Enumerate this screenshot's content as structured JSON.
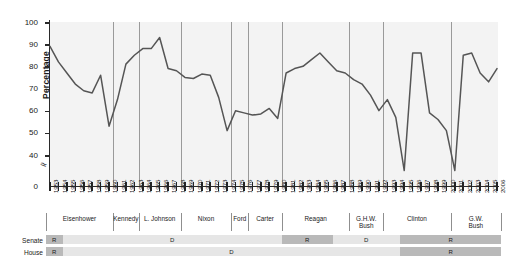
{
  "chart_data": {
    "type": "line",
    "title": "",
    "xlabel": "",
    "ylabel": "Percentage",
    "ylim": [
      0,
      100
    ],
    "yticks": [
      0,
      40,
      50,
      60,
      70,
      80,
      90,
      100
    ],
    "axis_break": true,
    "grid": false,
    "legend": "none",
    "x": [
      1953,
      1954,
      1955,
      1956,
      1957,
      1958,
      1959,
      1960,
      1961,
      1962,
      1963,
      1964,
      1965,
      1966,
      1967,
      1968,
      1969,
      1970,
      1971,
      1972,
      1973,
      1974,
      1975,
      1976,
      1977,
      1978,
      1979,
      1980,
      1981,
      1982,
      1983,
      1984,
      1985,
      1986,
      1987,
      1988,
      1989,
      1990,
      1991,
      1992,
      1993,
      1994,
      1995,
      1996,
      1997,
      1998,
      1999,
      2000,
      2001,
      2002,
      2003,
      2004,
      2005,
      2006
    ],
    "categories": [
      "1953",
      "1954",
      "1955",
      "1956",
      "1957",
      "1958",
      "1959",
      "1960",
      "1961",
      "1962",
      "1963",
      "1964",
      "1965",
      "1966",
      "1967",
      "1968",
      "1969",
      "1970",
      "1971",
      "1972",
      "1973",
      "1974",
      "1975",
      "1976",
      "1977",
      "1978",
      "1979",
      "1980",
      "1981",
      "1982",
      "1983",
      "1984",
      "1985",
      "1986",
      "1987",
      "1988",
      "1989",
      "1990",
      "1991",
      "1992",
      "1993",
      "1994",
      "1995",
      "1996",
      "1997",
      "1998",
      "1999",
      "2000",
      "2001",
      "2002",
      "2003",
      "2004",
      "2005",
      "2006"
    ],
    "values": [
      89,
      82,
      77,
      72,
      69,
      68,
      76,
      53,
      65,
      81,
      85,
      88,
      88,
      93,
      79,
      78,
      75,
      74.5,
      76.5,
      76,
      66,
      51,
      60,
      59,
      58,
      58.5,
      61,
      56.5,
      77,
      79,
      80,
      83,
      86,
      82,
      78,
      77,
      74,
      72,
      67,
      60,
      65,
      57,
      33,
      86,
      86,
      59,
      56,
      51,
      33,
      85,
      86,
      77,
      73,
      79
    ],
    "series": [
      {
        "name": "Presidential support in Congress",
        "values": [
          89,
          82,
          77,
          72,
          69,
          68,
          76,
          53,
          65,
          81,
          85,
          88,
          88,
          93,
          79,
          78,
          75,
          74.5,
          76.5,
          76,
          66,
          51,
          60,
          59,
          58,
          58.5,
          61,
          56.5,
          77,
          79,
          80,
          83,
          86,
          82,
          78,
          77,
          74,
          72,
          67,
          60,
          65,
          57,
          33,
          86,
          86,
          59,
          56,
          51,
          33,
          85,
          86,
          77,
          73,
          79
        ]
      }
    ],
    "line_color": "#555555"
  },
  "axis": {
    "y_label": "Percentage",
    "y_ticks": [
      "100",
      "90",
      "80",
      "70",
      "60",
      "50",
      "40",
      "0"
    ]
  },
  "presidents": [
    {
      "name": "Eisenhower",
      "start": 1953,
      "end": 1960
    },
    {
      "name": "Kennedy",
      "start": 1961,
      "end": 1963
    },
    {
      "name": "L. Johnson",
      "start": 1964,
      "end": 1968
    },
    {
      "name": "Nixon",
      "start": 1969,
      "end": 1974
    },
    {
      "name": "Ford",
      "start": 1975,
      "end": 1976
    },
    {
      "name": "Carter",
      "start": 1977,
      "end": 1980
    },
    {
      "name": "Reagan",
      "start": 1981,
      "end": 1988
    },
    {
      "name": "G.H.W.\nBush",
      "start": 1989,
      "end": 1992
    },
    {
      "name": "Clinton",
      "start": 1993,
      "end": 2000
    },
    {
      "name": "G.W.\nBush",
      "start": 2001,
      "end": 2006
    }
  ],
  "control_rows": [
    {
      "label": "Senate",
      "segments": [
        {
          "party": "R",
          "start": 1953,
          "end": 1954
        },
        {
          "party": "D",
          "start": 1955,
          "end": 1980
        },
        {
          "party": "R",
          "start": 1981,
          "end": 1986
        },
        {
          "party": "D",
          "start": 1987,
          "end": 1994
        },
        {
          "party": "R",
          "start": 1995,
          "end": 2006
        }
      ]
    },
    {
      "label": "House",
      "segments": [
        {
          "party": "R",
          "start": 1953,
          "end": 1954
        },
        {
          "party": "D",
          "start": 1955,
          "end": 1994
        },
        {
          "party": "R",
          "start": 1995,
          "end": 2006
        }
      ]
    }
  ],
  "colors": {
    "line": "#555555",
    "plot_background": "#f3f3f3",
    "republican": "#b9b9b9",
    "democrat": "#e6e6e6",
    "axis": "#2a2a2a",
    "divider": "#9a9a9a"
  }
}
